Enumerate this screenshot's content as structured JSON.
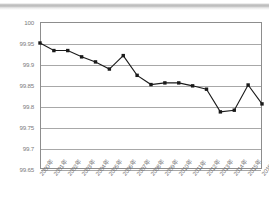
{
  "chart_data": {
    "type": "line",
    "title": "",
    "subtitle": "",
    "xlabel": "",
    "ylabel": "",
    "categories": [
      "2000年",
      "2001年",
      "2002年",
      "2003年",
      "2004年",
      "2005年",
      "2006年",
      "2007年",
      "2008年",
      "2009年",
      "2010年",
      "2011年",
      "2012年",
      "2013年",
      "2014年",
      "2015年",
      "2016年"
    ],
    "values": [
      99.95,
      99.932,
      99.932,
      99.917,
      99.905,
      99.888,
      99.92,
      99.873,
      99.851,
      99.855,
      99.855,
      99.848,
      99.84,
      99.786,
      99.79,
      99.85,
      99.805
    ],
    "series": [
      {
        "name": "",
        "values": [
          99.95,
          99.932,
          99.932,
          99.917,
          99.905,
          99.888,
          99.92,
          99.873,
          99.851,
          99.855,
          99.855,
          99.848,
          99.84,
          99.786,
          99.79,
          99.85,
          99.805
        ]
      }
    ],
    "ylim": [
      99.65,
      100
    ],
    "yticks": [
      100,
      99.95,
      99.9,
      99.85,
      99.8,
      99.75,
      99.7,
      99.65
    ],
    "ytick_labels": [
      "100",
      "99.95",
      "99.9",
      "99.85",
      "99.8",
      "99.75",
      "99.7",
      "99.65"
    ],
    "grid": true,
    "grid_axis": "y",
    "legend": false,
    "legend_position": "none",
    "marker": "square",
    "line_color": "#1a1a1a",
    "marker_color": "#1a1a1a",
    "grid_color": "#a8a8a8",
    "axis_color": "#8d8d8d",
    "tick_label_color": "#7a7a7a",
    "xtick_rotation": -52
  }
}
